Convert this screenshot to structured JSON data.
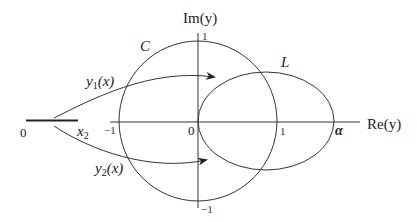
{
  "diagram": {
    "type": "complex-plane mapping diagram",
    "colors": {
      "stroke": "#333333",
      "text": "#222222",
      "background": "#ffffff"
    },
    "axes": {
      "real_label": "Re(y)",
      "imag_label": "Im(y)",
      "ticks": {
        "real_neg_one": "−1",
        "origin": "0",
        "real_one": "1",
        "real_alpha": "α",
        "imag_one": "1",
        "imag_neg_one": "−1"
      }
    },
    "curves": {
      "circle_label": "C",
      "ellipse_label": "L"
    },
    "segment": {
      "start_label": "0",
      "end_label": "x",
      "end_label_sub": "2"
    },
    "maps": [
      {
        "label": "y",
        "sub": "1",
        "arg": "(x)"
      },
      {
        "label": "y",
        "sub": "2",
        "arg": "(x)"
      }
    ]
  }
}
